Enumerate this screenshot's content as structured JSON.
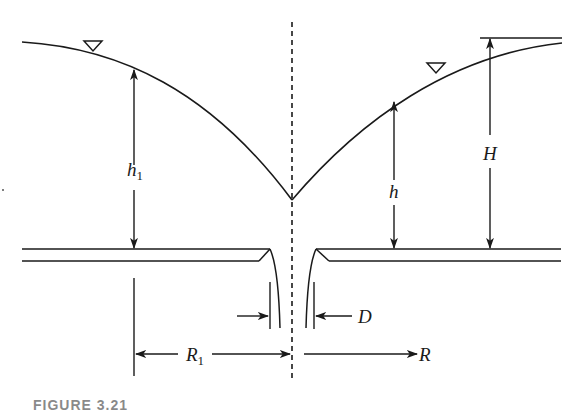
{
  "diagram": {
    "type": "well-drawdown-cross-section",
    "labels": {
      "h1": "h",
      "h1_sub": "1",
      "h": "h",
      "H": "H",
      "D": "D",
      "R1": "R",
      "R1_sub": "1",
      "R": "R"
    },
    "symbols": {
      "water_table_marker": "inverted-triangle"
    },
    "colors": {
      "line": "#1a1a1a",
      "background": "#ffffff"
    },
    "caption": "FIGURE 3.21"
  }
}
